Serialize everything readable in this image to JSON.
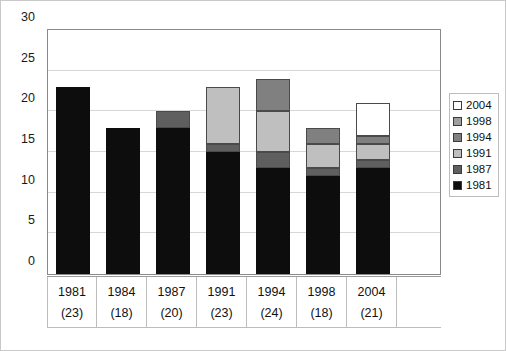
{
  "chart_data": {
    "type": "bar",
    "title": "",
    "xlabel": "",
    "ylabel": "",
    "stacked": true,
    "grid": true,
    "legend_position": "right",
    "ylim": [
      0,
      30
    ],
    "yticks": [
      0,
      5,
      10,
      15,
      20,
      25,
      30
    ],
    "ytick_labels": [
      "0",
      "5",
      "10",
      "15",
      "20",
      "25",
      "30"
    ],
    "categories": [
      "1981",
      "1984",
      "1987",
      "1991",
      "1994",
      "1998",
      "2004"
    ],
    "category_totals": [
      "(23)",
      "(18)",
      "(20)",
      "(23)",
      "(24)",
      "(18)",
      "(21)"
    ],
    "totals": [
      23,
      18,
      20,
      23,
      24,
      18,
      21
    ],
    "series": [
      {
        "name": "1981",
        "color": "#0d0d0d",
        "values": [
          23,
          18,
          18,
          15,
          13,
          12,
          13
        ]
      },
      {
        "name": "1987",
        "color": "#5f5f5f",
        "values": [
          0,
          0,
          2,
          1,
          2,
          1,
          1
        ]
      },
      {
        "name": "1991",
        "color": "#bfbfbf",
        "values": [
          0,
          0,
          0,
          7,
          5,
          3,
          2
        ]
      },
      {
        "name": "1994",
        "color": "#808080",
        "values": [
          0,
          0,
          0,
          0,
          4,
          2,
          1
        ]
      },
      {
        "name": "1998",
        "color": "#9e9e9e",
        "values": [
          0,
          0,
          0,
          0,
          0,
          0,
          0
        ]
      },
      {
        "name": "2004",
        "color": "#ffffff",
        "values": [
          0,
          0,
          0,
          0,
          0,
          0,
          4
        ]
      }
    ]
  },
  "legend": {
    "items": [
      {
        "label": "2004",
        "color": "#ffffff"
      },
      {
        "label": "1998",
        "color": "#9e9e9e"
      },
      {
        "label": "1994",
        "color": "#808080"
      },
      {
        "label": "1991",
        "color": "#bfbfbf"
      },
      {
        "label": "1987",
        "color": "#5f5f5f"
      },
      {
        "label": "1981",
        "color": "#0d0d0d"
      }
    ]
  }
}
